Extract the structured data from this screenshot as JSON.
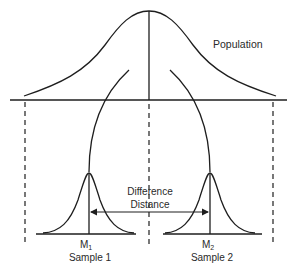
{
  "diagram": {
    "population_label": "Population",
    "difference_label_line1": "Difference",
    "difference_label_line2": "Distance",
    "sample1": {
      "mean_label": "M",
      "mean_subscript": "1",
      "name": "Sample 1"
    },
    "sample2": {
      "mean_label": "M",
      "mean_subscript": "2",
      "name": "Sample 2"
    },
    "colors": {
      "line": "#1e1e1e",
      "text": "#2a2a2a",
      "background": "#ffffff"
    }
  }
}
